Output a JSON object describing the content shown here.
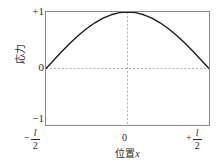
{
  "chart_data": {
    "type": "line",
    "title": "",
    "subtitle": "",
    "xlabel_text": "位置",
    "xlabel_var": "x",
    "ylabel": "応力",
    "xlim": [
      -0.5,
      0.5
    ],
    "ylim": [
      -1,
      1
    ],
    "grid": true,
    "grid_style": "dashed",
    "legend": "none",
    "x_unit": "l",
    "xticks": [
      {
        "value": -0.5,
        "sign": "−",
        "num": "l",
        "den": "2",
        "label": "−l/2"
      },
      {
        "value": 0,
        "sign": "",
        "num": "",
        "den": "",
        "label": "0"
      },
      {
        "value": 0.5,
        "sign": "+",
        "num": "l",
        "den": "2",
        "label": "+l/2"
      }
    ],
    "yticks": [
      {
        "value": 1,
        "label": "+1"
      },
      {
        "value": 0,
        "label": "0"
      },
      {
        "value": -1,
        "label": "−1"
      }
    ],
    "series": [
      {
        "name": "stress-distribution",
        "color": "#1a1a1a",
        "x": [
          -0.5,
          -0.45,
          -0.4,
          -0.35,
          -0.3,
          -0.25,
          -0.2,
          -0.15,
          -0.1,
          -0.05,
          0.0,
          0.05,
          0.1,
          0.15,
          0.2,
          0.25,
          0.3,
          0.35,
          0.4,
          0.45,
          0.5
        ],
        "y": [
          0.0,
          0.156,
          0.309,
          0.454,
          0.588,
          0.707,
          0.809,
          0.891,
          0.951,
          0.988,
          1.0,
          0.988,
          0.951,
          0.891,
          0.809,
          0.707,
          0.588,
          0.454,
          0.309,
          0.156,
          0.0
        ]
      }
    ],
    "gridlines": {
      "horizontal": [
        0
      ],
      "vertical": [
        0
      ]
    }
  },
  "colors": {
    "curve": "#1a1a1a",
    "frame": "#8a8a8a",
    "grid": "#9a9a9a",
    "text": "#2a2a2a",
    "background": "#ffffff"
  }
}
